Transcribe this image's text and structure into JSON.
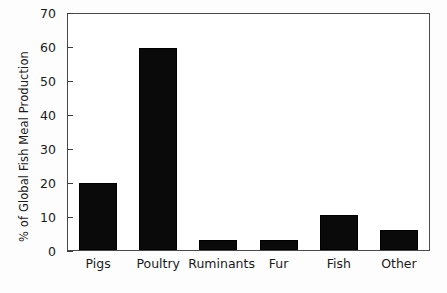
{
  "chart_data": {
    "type": "bar",
    "title": "",
    "xlabel": "",
    "ylabel": "% of Global Fish Meal Production",
    "categories": [
      "Pigs",
      "Poultry",
      "Ruminants",
      "Fur",
      "Fish",
      "Other"
    ],
    "values": [
      20,
      60,
      3,
      3,
      10.5,
      6
    ],
    "ylim": [
      0,
      70
    ],
    "yticks": [
      0,
      10,
      20,
      30,
      40,
      50,
      60,
      70
    ],
    "ytick_labels": [
      "0",
      "10",
      "20",
      "30",
      "40",
      "50",
      "60",
      "70"
    ],
    "grid": false,
    "legend": false,
    "bar_color": "#0a0a0a",
    "axis_color": "#3c3c3c",
    "background_color": "#ffffff"
  }
}
